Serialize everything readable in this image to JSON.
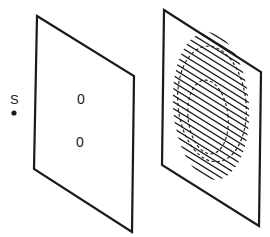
{
  "figure": {
    "source": {
      "label": "S",
      "x": 14,
      "y": 113,
      "label_x": 10,
      "label_y": 100
    },
    "aperture_screen": {
      "corners": [
        [
          37,
          16
        ],
        [
          134,
          76
        ],
        [
          132,
          232
        ],
        [
          34,
          169
        ]
      ],
      "holes": [
        {
          "label": "0",
          "x": 82,
          "y": 99
        },
        {
          "label": "0",
          "x": 81,
          "y": 142
        }
      ]
    },
    "fringe_screen": {
      "corners": [
        [
          164,
          10
        ],
        [
          261,
          72
        ],
        [
          259,
          226
        ],
        [
          162,
          165
        ]
      ],
      "fringes": {
        "count": 20,
        "slope": 0.62,
        "spacing": 6.6
      },
      "contours": [
        {
          "name": "outer",
          "cx": 212,
          "cy": 104,
          "rx": 34,
          "ry": 58
        },
        {
          "name": "inner",
          "cx": 208,
          "cy": 117,
          "rx": 20,
          "ry": 37
        }
      ]
    },
    "colors": {
      "ink": "#1a1a1a",
      "background": "#ffffff"
    }
  }
}
